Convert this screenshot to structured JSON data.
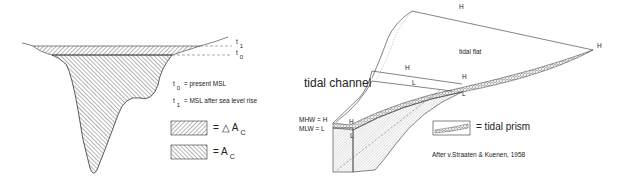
{
  "left_panel": {
    "level_labels": {
      "t1": "t",
      "t1_sub": "1",
      "t0": "t",
      "t0_sub": "0"
    },
    "legend": [
      {
        "symbol": "t",
        "sub": "0",
        "text": "= present MSL"
      },
      {
        "symbol": "t",
        "sub": "1",
        "text": "= MSL after sea level rise"
      }
    ],
    "area_legend": [
      {
        "pattern": "hatch-back",
        "eq": "= △ A",
        "sub": "C"
      },
      {
        "pattern": "hatch-fwd",
        "eq": "= A",
        "sub": "C"
      }
    ]
  },
  "right_panel": {
    "title": "tidal channel",
    "flat_label": "tidal flat",
    "markers": {
      "h": "H",
      "l": "L"
    },
    "mhw": "MHW = H",
    "mlw": "MLW = L",
    "prism_legend": "= tidal prism",
    "citation": "After v.Straaten & Kuenen, 1958"
  }
}
